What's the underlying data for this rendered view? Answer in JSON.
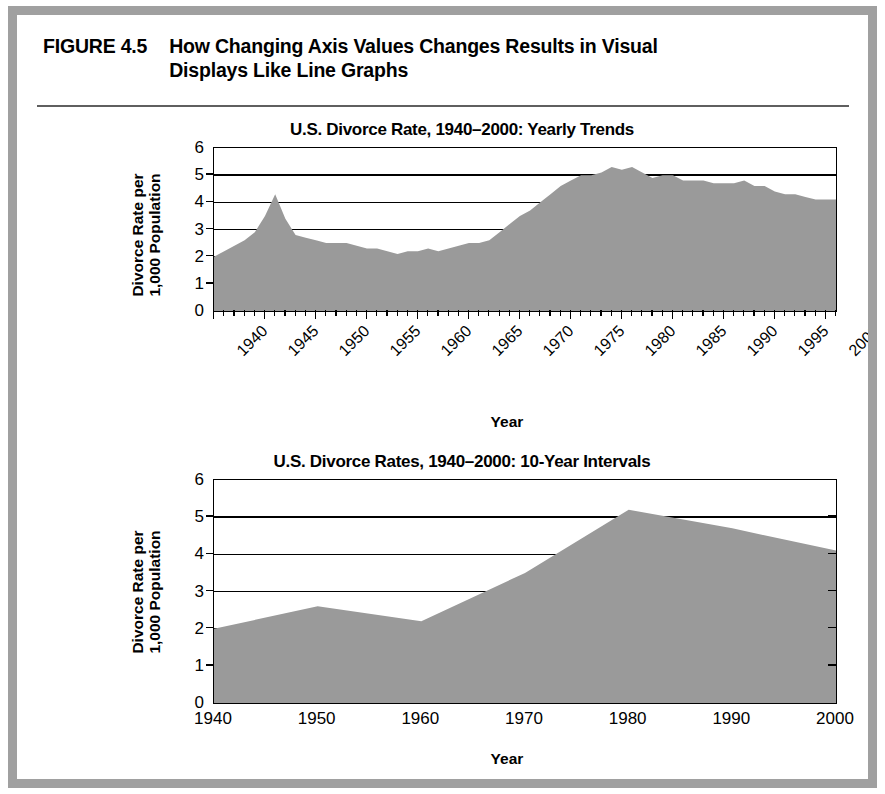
{
  "figure": {
    "label": "FIGURE 4.5",
    "title": "How Changing Axis Values Changes Results in Visual Displays Like Line Graphs",
    "title_line_1": "How Changing Axis Values Changes Results in Visual",
    "title_line_2": "Displays Like Line Graphs",
    "frame_color": "#a0a0a0",
    "fill_color": "#9a9a9a"
  },
  "chart_data": [
    {
      "type": "area",
      "title": "U.S. Divorce Rate, 1940–2000: Yearly Trends",
      "xlabel": "Year",
      "ylabel": "Divorce Rate per 1,000 Population",
      "ylabel_line_1": "Divorce Rate per",
      "ylabel_line_2": "1,000 Population",
      "ylim": [
        0,
        6
      ],
      "yticks": [
        0,
        1,
        2,
        3,
        4,
        5,
        6
      ],
      "ytick_labels": [
        "0",
        "1",
        "2",
        "3",
        "4",
        "5",
        "6"
      ],
      "xlim": [
        1940,
        2001
      ],
      "xticks": [
        1940,
        1945,
        1950,
        1955,
        1960,
        1965,
        1970,
        1975,
        1980,
        1985,
        1990,
        1995,
        2000
      ],
      "xtick_labels": [
        "1940",
        "1945",
        "1950",
        "1955",
        "1960",
        "1965",
        "1970",
        "1975",
        "1980",
        "1985",
        "1990",
        "1995",
        "2000"
      ],
      "grid": true,
      "x": [
        1940,
        1941,
        1942,
        1943,
        1944,
        1945,
        1946,
        1947,
        1948,
        1949,
        1950,
        1951,
        1952,
        1953,
        1954,
        1955,
        1956,
        1957,
        1958,
        1959,
        1960,
        1961,
        1962,
        1963,
        1964,
        1965,
        1966,
        1967,
        1968,
        1969,
        1970,
        1971,
        1972,
        1973,
        1974,
        1975,
        1976,
        1977,
        1978,
        1979,
        1980,
        1981,
        1982,
        1983,
        1984,
        1985,
        1986,
        1987,
        1988,
        1989,
        1990,
        1991,
        1992,
        1993,
        1994,
        1995,
        1996,
        1997,
        1998,
        1999,
        2000,
        2001
      ],
      "values": [
        2.0,
        2.2,
        2.4,
        2.6,
        2.9,
        3.5,
        4.3,
        3.4,
        2.8,
        2.7,
        2.6,
        2.5,
        2.5,
        2.5,
        2.4,
        2.3,
        2.3,
        2.2,
        2.1,
        2.2,
        2.2,
        2.3,
        2.2,
        2.3,
        2.4,
        2.5,
        2.5,
        2.6,
        2.9,
        3.2,
        3.5,
        3.7,
        4.0,
        4.3,
        4.6,
        4.8,
        5.0,
        5.0,
        5.1,
        5.3,
        5.2,
        5.3,
        5.1,
        4.9,
        5.0,
        5.0,
        4.8,
        4.8,
        4.8,
        4.7,
        4.7,
        4.7,
        4.8,
        4.6,
        4.6,
        4.4,
        4.3,
        4.3,
        4.2,
        4.1,
        4.1,
        4.1
      ]
    },
    {
      "type": "area",
      "title": "U.S. Divorce Rates, 1940–2000: 10-Year Intervals",
      "xlabel": "Year",
      "ylabel": "Divorce Rate per 1,000 Population",
      "ylabel_line_1": "Divorce Rate per",
      "ylabel_line_2": "1,000 Population",
      "ylim": [
        0,
        6
      ],
      "yticks": [
        0,
        1,
        2,
        3,
        4,
        5,
        6
      ],
      "ytick_labels": [
        "0",
        "1",
        "2",
        "3",
        "4",
        "5",
        "6"
      ],
      "xlim": [
        1940,
        2000
      ],
      "xticks": [
        1940,
        1950,
        1960,
        1970,
        1980,
        1990,
        2000
      ],
      "xtick_labels": [
        "1940",
        "1950",
        "1960",
        "1970",
        "1980",
        "1990",
        "2000"
      ],
      "grid": true,
      "x": [
        1940,
        1950,
        1960,
        1970,
        1980,
        1990,
        2000
      ],
      "values": [
        2.0,
        2.6,
        2.2,
        3.5,
        5.2,
        4.7,
        4.1
      ]
    }
  ]
}
